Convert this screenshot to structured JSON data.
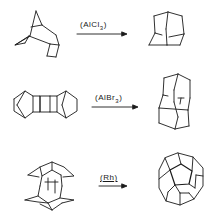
{
  "reactions": [
    {
      "reactant": "tetrahydrodicyclopentadiene",
      "reagent_prefix": "(AlCl",
      "reagent_sub": "3",
      "reagent_suffix": ")",
      "product": "adamantane"
    },
    {
      "reactant": "bis-norbornyl cyclobutane dimer",
      "reagent_prefix": "(AlBr",
      "reagent_sub": "3",
      "reagent_suffix": ")",
      "product": "diamantane"
    },
    {
      "reactant": "pagodane-type C20 polycycle",
      "reagent_prefix": "(Rh)",
      "reagent_sub": "",
      "reagent_suffix": "",
      "product": "dodecahedrane"
    }
  ],
  "colors": {
    "ink": "#1a1a1a",
    "background": "#ffffff"
  }
}
